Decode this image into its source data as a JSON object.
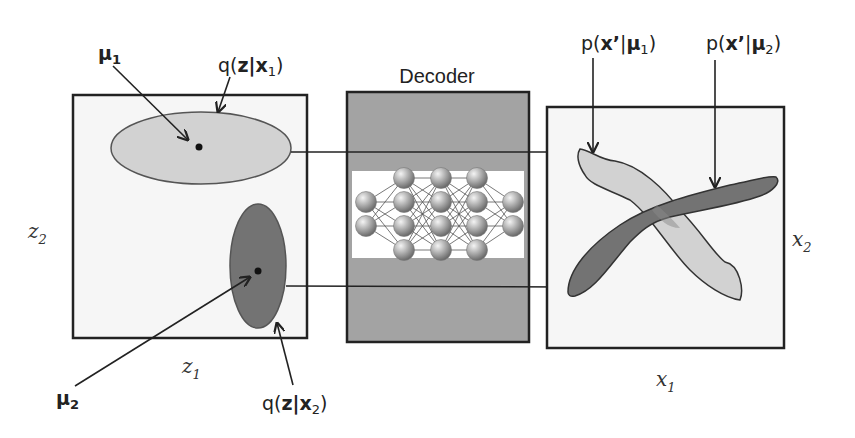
{
  "decoder": {
    "title": "Decoder",
    "network_layers": [
      2,
      4,
      4,
      4,
      2
    ]
  },
  "latent_space": {
    "axis_x": {
      "base": "z",
      "sub": "1"
    },
    "axis_y": {
      "base": "z",
      "sub": "2"
    },
    "mu1": {
      "base": "μ",
      "sub": "1"
    },
    "mu2": {
      "base": "μ",
      "sub": "2"
    },
    "q1": {
      "prefix": "q(",
      "bold": "z",
      "bar": "|",
      "var": "x",
      "sub": "1",
      "suffix": ")"
    },
    "q2": {
      "prefix": "q(",
      "bold": "z",
      "bar": "|",
      "var": "x",
      "sub": "2",
      "suffix": ")"
    }
  },
  "data_space": {
    "axis_x": {
      "base": "x",
      "sub": "1"
    },
    "axis_y": {
      "base": "x",
      "sub": "2"
    },
    "p1": {
      "prefix": "p(",
      "bold": "x’",
      "bar": "|",
      "mu": "μ",
      "sub": "1",
      "suffix": ")"
    },
    "p2": {
      "prefix": "p(",
      "bold": "x’",
      "bar": "|",
      "mu": "μ",
      "sub": "2",
      "suffix": ")"
    }
  },
  "colors": {
    "box_fill": "#f6f6f6",
    "light_shape": "#d2d2d2",
    "dark_shape": "#737373",
    "decoder_fill": "#a3a3a3",
    "stroke": "#222222"
  }
}
